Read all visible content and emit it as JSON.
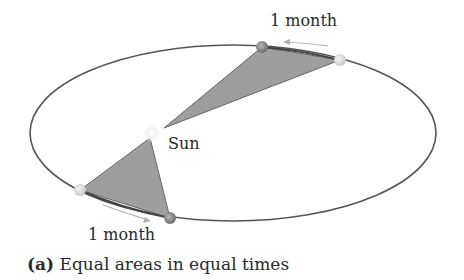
{
  "diagram": {
    "labels": {
      "top_interval": "1 month",
      "bottom_interval": "1 month",
      "sun": "Sun"
    },
    "caption": {
      "tag": "(a)",
      "text": " Equal areas in equal times"
    },
    "colors": {
      "orbit": "#555555",
      "swept_area": "#9a9a9a",
      "planet_dark": "#8a8a8a",
      "planet_light": "#dcdcdc",
      "arrow": "#b0b0b0"
    }
  }
}
